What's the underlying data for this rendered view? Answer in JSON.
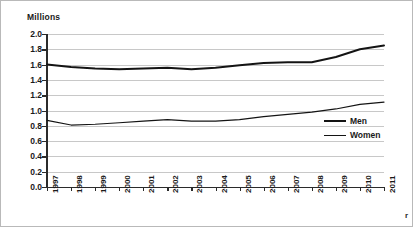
{
  "chart_data": {
    "type": "line",
    "title": "",
    "subtitle": "",
    "ylabel": "Millions",
    "xlabel": "",
    "ylim": [
      0.0,
      2.0
    ],
    "ytick_step": 0.2,
    "yticks": [
      "2.0",
      "1.8",
      "1.6",
      "1.4",
      "1.2",
      "1.0",
      "0.8",
      "0.6",
      "0.4",
      "0.2",
      "0.0"
    ],
    "grid": true,
    "grid_axis": "y",
    "legend_position": "center-right",
    "categories": [
      "1997",
      "1998",
      "1999",
      "2000",
      "2001",
      "2002",
      "2003",
      "2004",
      "2005",
      "2006",
      "2007",
      "2008",
      "2009",
      "2010",
      "2011"
    ],
    "series": [
      {
        "name": "Men",
        "color": "#141414",
        "line_width": 2,
        "values": [
          1.6,
          1.57,
          1.55,
          1.54,
          1.55,
          1.56,
          1.54,
          1.56,
          1.59,
          1.62,
          1.63,
          1.63,
          1.7,
          1.8,
          1.85
        ]
      },
      {
        "name": "Women",
        "color": "#141414",
        "line_width": 1.2,
        "values": [
          0.87,
          0.81,
          0.82,
          0.84,
          0.86,
          0.88,
          0.86,
          0.86,
          0.88,
          0.92,
          0.95,
          0.98,
          1.02,
          1.08,
          1.11
        ]
      }
    ],
    "annotations": [
      {
        "name": "corner-marker",
        "text": "r"
      }
    ]
  }
}
